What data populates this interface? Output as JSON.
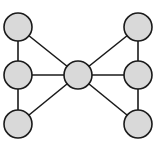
{
  "diagram": {
    "type": "graph",
    "width": 162,
    "height": 153,
    "colors": {
      "background": "#ffffff",
      "node_fill": "#d9d9d9",
      "node_stroke": "#1a1a1a",
      "edge_stroke": "#1a1a1a"
    },
    "node_radius": 14,
    "nodes": [
      {
        "id": "top-left",
        "x": 18,
        "y": 27
      },
      {
        "id": "middle-left",
        "x": 18,
        "y": 75
      },
      {
        "id": "bottom-left",
        "x": 18,
        "y": 124
      },
      {
        "id": "center",
        "x": 78,
        "y": 75
      },
      {
        "id": "top-right",
        "x": 138,
        "y": 27
      },
      {
        "id": "middle-right",
        "x": 138,
        "y": 75
      },
      {
        "id": "bottom-right",
        "x": 138,
        "y": 124
      }
    ],
    "edges": [
      {
        "from": "top-left",
        "to": "middle-left"
      },
      {
        "from": "middle-left",
        "to": "bottom-left"
      },
      {
        "from": "top-left",
        "to": "center"
      },
      {
        "from": "middle-left",
        "to": "center"
      },
      {
        "from": "bottom-left",
        "to": "center"
      },
      {
        "from": "top-right",
        "to": "middle-right"
      },
      {
        "from": "middle-right",
        "to": "bottom-right"
      },
      {
        "from": "top-right",
        "to": "center"
      },
      {
        "from": "middle-right",
        "to": "center"
      },
      {
        "from": "bottom-right",
        "to": "center"
      }
    ]
  }
}
